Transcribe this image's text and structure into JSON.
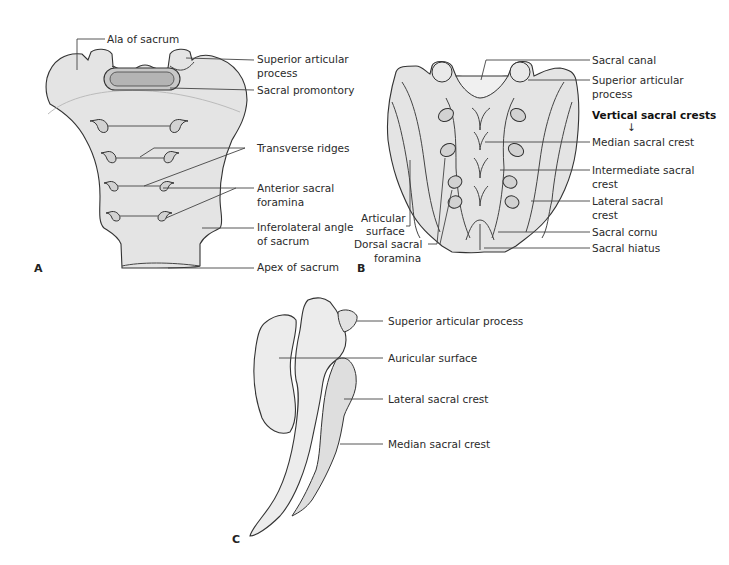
{
  "figure": {
    "panels": {
      "a": {
        "letter": "A",
        "view": "anterior"
      },
      "b": {
        "letter": "B",
        "view": "posterior"
      },
      "c": {
        "letter": "C",
        "view": "lateral"
      }
    },
    "panel_a_labels": {
      "ala": "Ala of sacrum",
      "superior_articular_1": "Superior articular",
      "superior_articular_2": "process",
      "promontory": "Sacral promontory",
      "transverse_ridges": "Transverse ridges",
      "anterior_foramina_1": "Anterior sacral",
      "anterior_foramina_2": "foramina",
      "inferolateral_1": "Inferolateral angle",
      "inferolateral_2": "of sacrum",
      "apex": "Apex of sacrum"
    },
    "panel_b_labels": {
      "sacral_canal": "Sacral canal",
      "superior_articular_1": "Superior articular",
      "superior_articular_2": "process",
      "vertical_crests_heading": "Vertical sacral crests",
      "arrow": "↓",
      "median_crest": "Median sacral crest",
      "intermediate_crest_1": "Intermediate sacral",
      "intermediate_crest_2": "crest",
      "lateral_crest_1": "Lateral sacral",
      "lateral_crest_2": "crest",
      "cornu": "Sacral cornu",
      "hiatus": "Sacral hiatus",
      "articular_surface_1": "Articular",
      "articular_surface_2": "surface",
      "dorsal_foramina_1": "Dorsal sacral",
      "dorsal_foramina_2": "foramina"
    },
    "panel_c_labels": {
      "superior_articular": "Superior articular process",
      "auricular": "Auricular surface",
      "lateral_crest": "Lateral sacral crest",
      "median_crest": "Median sacral crest"
    },
    "colors": {
      "bone_fill": "#e4e4e4",
      "outline": "#333333",
      "text": "#2a2a2a",
      "background": "#ffffff"
    }
  }
}
